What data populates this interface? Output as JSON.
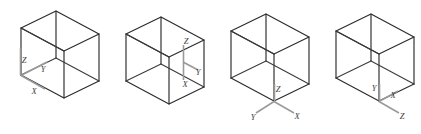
{
  "figure": {
    "background_color": "#ffffff",
    "edge_color": "#2b2b2b",
    "axis_color": "#9a9a9a",
    "label_color": "#3d3d3d",
    "box_count": 4
  },
  "boxes": [
    {
      "id": "box-1",
      "name": "box-1",
      "origin_x": 14,
      "origin_y": 10,
      "axis_origin_vertex": "left-front-bottom",
      "axes": [
        {
          "letter": "Z",
          "name": "z-axis",
          "dir": "up",
          "label_x": 22.5,
          "label_y": 60.5,
          "end_x": 20.5,
          "end_y": 48
        },
        {
          "letter": "Y",
          "name": "y-axis",
          "dir": "upper-right",
          "label_x": 41.5,
          "label_y": 77.5,
          "end_x": 44,
          "end_y": 68
        },
        {
          "letter": "X",
          "name": "x-axis",
          "dir": "lower-right",
          "label_x": 36.5,
          "label_y": 94.5,
          "end_x": 44,
          "end_y": 94
        }
      ]
    },
    {
      "id": "box-2",
      "name": "box-2",
      "origin_x": 119,
      "origin_y": 10,
      "axis_origin_vertex": "right-back-middle",
      "axes": [
        {
          "letter": "Z",
          "name": "z-axis",
          "dir": "up",
          "label_x": 184.5,
          "label_y": 41.5,
          "end_x": 183,
          "end_y": 48
        },
        {
          "letter": "Y",
          "name": "y-axis",
          "dir": "right",
          "label_x": 196.5,
          "label_y": 66.5,
          "end_x": 193,
          "end_y": 62
        },
        {
          "letter": "X",
          "name": "x-axis",
          "dir": "down",
          "label_x": 186.5,
          "label_y": 81.5,
          "end_x": 183,
          "end_y": 76
        }
      ]
    },
    {
      "id": "box-3",
      "name": "box-3",
      "origin_x": 224,
      "origin_y": 10,
      "axis_origin_vertex": "front-bottom",
      "axes": [
        {
          "letter": "Z",
          "name": "z-axis",
          "dir": "up",
          "label_x": 281.5,
          "label_y": 98.5,
          "end_x": 279,
          "end_y": 92
        },
        {
          "letter": "Y",
          "name": "y-axis",
          "dir": "lower-left",
          "label_x": 256.5,
          "label_y": 120.5,
          "end_x": 262,
          "end_y": 117
        },
        {
          "letter": "X",
          "name": "x-axis",
          "dir": "lower-right",
          "label_x": 295.5,
          "label_y": 119.5,
          "end_x": 292,
          "end_y": 117
        }
      ]
    },
    {
      "id": "box-4",
      "name": "box-4",
      "origin_x": 329,
      "origin_y": 10,
      "axis_origin_vertex": "front-bottom",
      "axes": [
        {
          "letter": "Y",
          "name": "y-axis",
          "dir": "up-left",
          "label_x": 372.5,
          "label_y": 96.5,
          "end_x": 376,
          "end_y": 95
        },
        {
          "letter": "X",
          "name": "x-axis",
          "dir": "upper-right",
          "label_x": 392.5,
          "label_y": 103.5,
          "end_x": 397,
          "end_y": 101
        },
        {
          "letter": "Z",
          "name": "z-axis",
          "dir": "lower-right",
          "label_x": 398.5,
          "label_y": 124.5,
          "end_x": 395,
          "end_y": 122
        }
      ]
    }
  ],
  "labels": {
    "x": "X",
    "y": "Y",
    "z": "Z"
  }
}
